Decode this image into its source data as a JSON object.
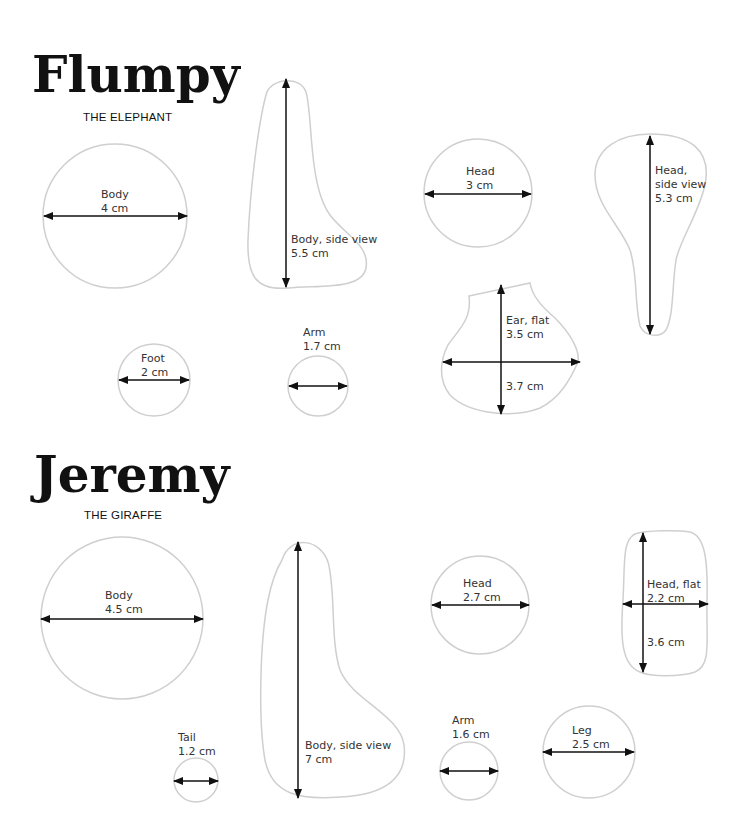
{
  "page": {
    "top_strip_text": "",
    "outline_color": "#cfcfcf",
    "arrow_color": "#111111"
  },
  "sections": [
    {
      "name": "Flumpy",
      "subtitle": "THE ELEPHANT",
      "parts": [
        {
          "label": "Body",
          "measure": "4 cm",
          "shape": "circle"
        },
        {
          "label": "Body, side view",
          "measure": "5.5 cm",
          "shape": "freeform"
        },
        {
          "label": "Head",
          "measure": "3 cm",
          "shape": "circle"
        },
        {
          "label": "Head,",
          "label2": "side view",
          "measure": "5.3 cm",
          "shape": "freeform"
        },
        {
          "label": "Foot",
          "measure": "2 cm",
          "shape": "circle"
        },
        {
          "label": "Arm",
          "measure": "1.7 cm",
          "shape": "circle"
        },
        {
          "label": "Ear, flat",
          "measure": "3.5 cm",
          "measure2": "3.7 cm",
          "shape": "freeform"
        }
      ]
    },
    {
      "name": "Jeremy",
      "subtitle": "THE GIRAFFE",
      "parts": [
        {
          "label": "Body",
          "measure": "4.5 cm",
          "shape": "circle"
        },
        {
          "label": "Body, side view",
          "measure": "7 cm",
          "shape": "freeform"
        },
        {
          "label": "Head",
          "measure": "2.7 cm",
          "shape": "circle"
        },
        {
          "label": "Head, flat",
          "measure": "2.2 cm",
          "measure2": "3.6 cm",
          "shape": "freeform"
        },
        {
          "label": "Tail",
          "measure": "1.2 cm",
          "shape": "circle"
        },
        {
          "label": "Arm",
          "measure": "1.6 cm",
          "shape": "circle"
        },
        {
          "label": "Leg",
          "measure": "2.5 cm",
          "shape": "circle"
        }
      ]
    }
  ]
}
